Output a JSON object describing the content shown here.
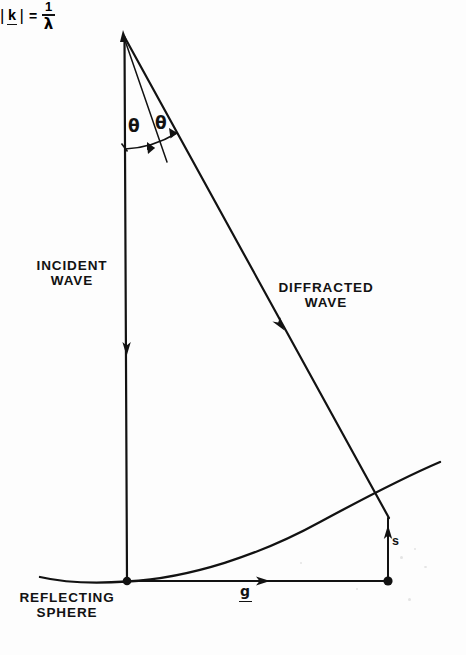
{
  "figure": {
    "background_color": "#fdfdfd",
    "ink_color": "#121212",
    "width": 466,
    "height": 655
  },
  "labels": {
    "incident_wave": "INCIDENT\nWAVE",
    "diffracted_wave": "DIFFRACTED\nWAVE",
    "reflecting_sphere": "REFLECTING\nSPHERE",
    "theta_1": "θ",
    "theta_2": "θ",
    "g_vector": "g",
    "s_vector": "s"
  },
  "formula": {
    "bar_left": "|",
    "k_symbol": "k",
    "bar_right": "|",
    "equals": "=",
    "numerator": "1",
    "denominator": "λ",
    "plain_text": "|k| = 1/λ"
  },
  "geometry": {
    "apex": {
      "x": 123,
      "y": 33
    },
    "origin": {
      "x": 127,
      "y": 581
    },
    "g_endpoint": {
      "x": 388,
      "y": 581
    },
    "sphere_intersection": {
      "x": 388,
      "y": 517
    },
    "incident_arrow_tip": {
      "x": 127,
      "y": 354
    },
    "diffracted_arrow_tip": {
      "x": 283,
      "y": 328
    },
    "g_arrow_tip": {
      "x": 268,
      "y": 581
    },
    "s_arrow_tip": {
      "x": 388,
      "y": 527
    },
    "angle_arc_start": {
      "x": 127,
      "y": 149
    },
    "angle_arc_end": {
      "x": 177,
      "y": 133
    },
    "sphere_curve_left": {
      "x": 42,
      "y": 577
    },
    "sphere_curve_right": {
      "x": 440,
      "y": 477
    },
    "sphere_curve_min": {
      "x": 127,
      "y": 582
    }
  },
  "colors": {
    "ink": "#121212",
    "paper": "#fdfdfd"
  }
}
